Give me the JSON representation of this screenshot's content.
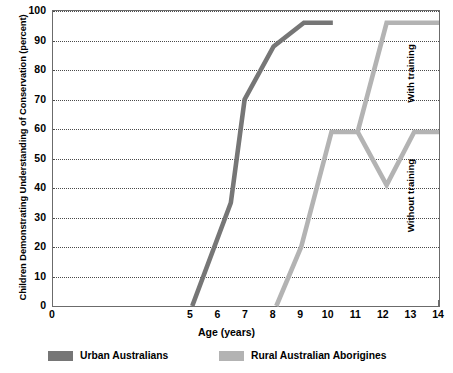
{
  "chart_data": {
    "type": "line",
    "title": "",
    "xlabel": "Age (years)",
    "ylabel": "Children Demonstrating Understanding of Conservation (percent)",
    "xlim": [
      0,
      14
    ],
    "ylim": [
      0,
      100
    ],
    "xticks": [
      0,
      1,
      2,
      3,
      4,
      5,
      6,
      7,
      8,
      9,
      10,
      11,
      12,
      13,
      14
    ],
    "xtick_labels": [
      "0",
      "1",
      "2",
      "3",
      "4",
      "5",
      "6",
      "7",
      "8",
      "9",
      "10",
      "11",
      "12",
      "13",
      "14"
    ],
    "xticks_shown": [
      0,
      5,
      6,
      7,
      8,
      9,
      10,
      11,
      12,
      13,
      14
    ],
    "yticks": [
      0,
      10,
      20,
      30,
      40,
      50,
      60,
      70,
      80,
      90,
      100
    ],
    "ytick_labels": [
      "0",
      "10",
      "20",
      "30",
      "40",
      "50",
      "60",
      "70",
      "80",
      "90",
      "100"
    ],
    "grid": true,
    "grid_axis": "y",
    "grid_style": "dotted",
    "legend_position": "bottom",
    "series": [
      {
        "name": "Urban Australians",
        "color": "#767676",
        "points": [
          {
            "x": 5.05,
            "y": 0
          },
          {
            "x": 6.45,
            "y": 35
          },
          {
            "x": 6.95,
            "y": 70
          },
          {
            "x": 8.0,
            "y": 88
          },
          {
            "x": 9.1,
            "y": 96
          },
          {
            "x": 10.15,
            "y": 96
          }
        ]
      },
      {
        "name": "Rural Australian Aborigines",
        "color": "#b3b3b3",
        "points": [
          {
            "x": 8.1,
            "y": 0
          },
          {
            "x": 9.0,
            "y": 20
          },
          {
            "x": 10.1,
            "y": 59
          },
          {
            "x": 11.05,
            "y": 59
          }
        ]
      },
      {
        "name": "Rural Australian Aborigines - with training",
        "color": "#b3b3b3",
        "branch_of": "Rural Australian Aborigines",
        "points": [
          {
            "x": 11.05,
            "y": 59
          },
          {
            "x": 12.1,
            "y": 96
          },
          {
            "x": 14.0,
            "y": 96
          }
        ]
      },
      {
        "name": "Rural Australian Aborigines - without training",
        "color": "#b3b3b3",
        "branch_of": "Rural Australian Aborigines",
        "points": [
          {
            "x": 11.05,
            "y": 59
          },
          {
            "x": 12.1,
            "y": 41
          },
          {
            "x": 13.1,
            "y": 59
          },
          {
            "x": 14.0,
            "y": 59
          }
        ]
      }
    ],
    "annotations": [
      {
        "text": "With training",
        "orientation": "vertical",
        "position": "right",
        "near_y": 96
      },
      {
        "text": "Without training",
        "orientation": "vertical",
        "position": "right",
        "near_y": 59
      }
    ]
  },
  "legend": {
    "items": [
      {
        "label": "Urban Australians",
        "color": "#767676"
      },
      {
        "label": "Rural Australian Aborigines",
        "color": "#b3b3b3"
      }
    ]
  },
  "colors": {
    "urban": "#767676",
    "rural": "#b3b3b3",
    "axis": "#6b6b6b",
    "grid": "#4a4a4a",
    "text": "#000000",
    "background": "#ffffff"
  }
}
